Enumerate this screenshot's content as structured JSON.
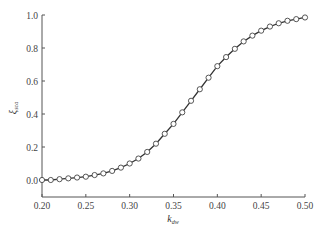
{
  "chart_data": {
    "type": "line",
    "title": "",
    "xlabel": "k_dw",
    "ylabel": "ξ_sca",
    "xlim": [
      0.2,
      0.5
    ],
    "ylim": [
      -0.08,
      1.0
    ],
    "xticks": [
      "0.20",
      "0.25",
      "0.30",
      "0.35",
      "0.40",
      "0.45",
      "0.50"
    ],
    "yticks": [
      "0.0",
      "0.2",
      "0.4",
      "0.6",
      "0.8",
      "1.0"
    ],
    "grid": false,
    "legend": null,
    "series": [
      {
        "name": "ξ_sca",
        "marker": "open-circle",
        "line": "solid",
        "x": [
          0.2,
          0.21,
          0.22,
          0.23,
          0.24,
          0.25,
          0.26,
          0.27,
          0.28,
          0.29,
          0.3,
          0.31,
          0.32,
          0.33,
          0.34,
          0.35,
          0.36,
          0.37,
          0.38,
          0.39,
          0.4,
          0.41,
          0.42,
          0.43,
          0.44,
          0.45,
          0.46,
          0.47,
          0.48,
          0.49,
          0.5
        ],
        "y": [
          0.0,
          0.0,
          0.005,
          0.01,
          0.015,
          0.02,
          0.03,
          0.04,
          0.055,
          0.075,
          0.1,
          0.13,
          0.17,
          0.22,
          0.28,
          0.34,
          0.41,
          0.48,
          0.55,
          0.62,
          0.69,
          0.745,
          0.795,
          0.84,
          0.875,
          0.905,
          0.93,
          0.95,
          0.965,
          0.975,
          0.985
        ]
      }
    ]
  },
  "labels": {
    "xlabel_main": "k",
    "xlabel_sub": "dw",
    "ylabel_main": "ξ",
    "ylabel_sub": "sca"
  }
}
